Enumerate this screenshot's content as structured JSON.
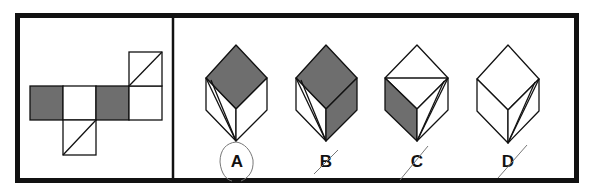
{
  "puzzle": {
    "type": "cube-net folding question",
    "colors": {
      "shade": "#6e6e6e",
      "line": "#111111",
      "background": "#ffffff",
      "pencil": "#777777"
    },
    "options": [
      {
        "label": "A",
        "mark": "circled"
      },
      {
        "label": "B",
        "mark": "slashed"
      },
      {
        "label": "C",
        "mark": "slashed"
      },
      {
        "label": "D",
        "mark": "slashed"
      }
    ]
  }
}
